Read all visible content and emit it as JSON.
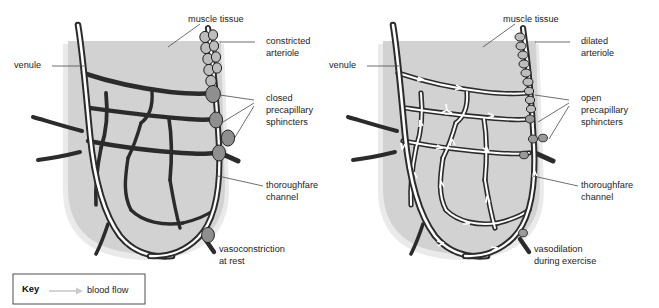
{
  "figure": {
    "title_present": false,
    "background_color": "#ffffff",
    "tissue_color": "#d2d2d2",
    "vessel_color": "#2b2b2b",
    "sphincter_color": "#8f8f8f",
    "lumen_color": "#ffffff"
  },
  "panels": [
    {
      "id": "left",
      "state": "rest",
      "labels": {
        "muscle_tissue": "muscle tissue",
        "venule": "venule",
        "arteriole": "constricted\narteriole",
        "arteriole_line1": "constricted",
        "arteriole_line2": "arteriole",
        "sphincters_line1": "closed",
        "sphincters_line2": "precapillary",
        "sphincters_line3": "sphincters",
        "thoroughfare_line1": "thoroughfare",
        "thoroughfare_line2": "channel",
        "caption_line1": "vasoconstriction",
        "caption_line2": "at rest"
      },
      "sphincter_count": 4,
      "arteriole_ring_count": 9,
      "blood_flow_arrows": 0
    },
    {
      "id": "right",
      "state": "exercise",
      "labels": {
        "muscle_tissue": "muscle tissue",
        "venule": "venule",
        "arteriole_line1": "dilated",
        "arteriole_line2": "arteriole",
        "sphincters_line1": "open",
        "sphincters_line2": "precapillary",
        "sphincters_line3": "sphincters",
        "thoroughfare_line1": "thoroughfare",
        "thoroughfare_line2": "channel",
        "caption_line1": "vasodilation",
        "caption_line2": "during exercise"
      },
      "sphincter_count": 4,
      "arteriole_ring_count": 9,
      "blood_flow_arrows": 14
    }
  ],
  "key": {
    "title": "Key",
    "entry_label": "blood flow",
    "arrow_color": "#c9c9c9"
  }
}
